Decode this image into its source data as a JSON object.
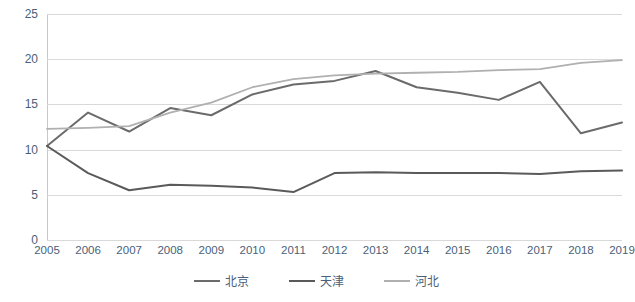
{
  "chart_data": {
    "type": "line",
    "title": "",
    "xlabel": "",
    "ylabel": "",
    "ylim": [
      0,
      25
    ],
    "yticks": [
      0,
      5,
      10,
      15,
      20,
      25
    ],
    "grid": true,
    "legend_position": "bottom",
    "categories": [
      "2005",
      "2006",
      "2007",
      "2008",
      "2009",
      "2010",
      "2011",
      "2012",
      "2013",
      "2014",
      "2015",
      "2016",
      "2017",
      "2018",
      "2019"
    ],
    "series": [
      {
        "name": "北京",
        "color": "#6b6b6b",
        "values": [
          10.4,
          14.1,
          12.0,
          14.6,
          13.8,
          16.1,
          17.2,
          17.6,
          18.7,
          16.9,
          16.3,
          15.5,
          17.5,
          11.8,
          13.0
        ]
      },
      {
        "name": "天津",
        "color": "#5a5a5a",
        "values": [
          10.4,
          7.4,
          5.5,
          6.1,
          6.0,
          5.8,
          5.3,
          7.4,
          7.5,
          7.4,
          7.4,
          7.4,
          7.3,
          7.6,
          7.7
        ]
      },
      {
        "name": "河北",
        "color": "#b0b0b0",
        "values": [
          12.3,
          12.4,
          12.6,
          14.1,
          15.2,
          16.9,
          17.8,
          18.2,
          18.4,
          18.5,
          18.6,
          18.8,
          18.9,
          19.6,
          19.9
        ]
      }
    ]
  },
  "legend": {
    "items": [
      {
        "label": "北京",
        "color": "#6b6b6b"
      },
      {
        "label": "天津",
        "color": "#5a5a5a"
      },
      {
        "label": "河北",
        "color": "#b0b0b0"
      }
    ]
  }
}
